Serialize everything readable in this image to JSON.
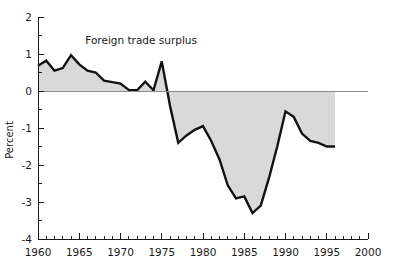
{
  "chart_data": {
    "type": "area",
    "title": "",
    "xlabel": "",
    "ylabel": "Percent",
    "xlim": [
      1960,
      2000
    ],
    "ylim": [
      -4,
      2
    ],
    "grid": false,
    "legend_position": "inline-annotation",
    "annotations": [
      {
        "text": "Foreign trade surplus",
        "x": 1972.5,
        "y": 1.28
      }
    ],
    "axis_colors": {
      "line": "#1a1a1a",
      "zero_line": "#8c8c8c"
    },
    "series": [
      {
        "name": "Foreign trade surplus",
        "fill_color": "#d9d9d9",
        "line_color": "#121212",
        "baseline": 0,
        "x": [
          1960,
          1961,
          1962,
          1963,
          1964,
          1965,
          1966,
          1967,
          1968,
          1969,
          1970,
          1971,
          1972,
          1973,
          1974,
          1975,
          1976,
          1977,
          1978,
          1979,
          1980,
          1981,
          1982,
          1983,
          1984,
          1985,
          1986,
          1987,
          1988,
          1989,
          1990,
          1991,
          1992,
          1993,
          1994,
          1995,
          1996
        ],
        "values": [
          0.68,
          0.82,
          0.55,
          0.62,
          0.97,
          0.72,
          0.55,
          0.5,
          0.28,
          0.24,
          0.2,
          0.03,
          0.02,
          0.25,
          0.02,
          0.8,
          -0.4,
          -1.4,
          -1.2,
          -1.05,
          -0.95,
          -1.35,
          -1.85,
          -2.55,
          -2.9,
          -2.85,
          -3.3,
          -3.1,
          -2.35,
          -1.5,
          -0.55,
          -0.7,
          -1.15,
          -1.35,
          -1.4,
          -1.5,
          -1.5
        ]
      }
    ],
    "x_axis": {
      "tick_step": 1,
      "label_step": 5,
      "tick_labels": [
        "1960",
        "1965",
        "1970",
        "1975",
        "1980",
        "1985",
        "1990",
        "1995",
        "2000"
      ],
      "tick_label_values": [
        1960,
        1965,
        1970,
        1975,
        1980,
        1985,
        1990,
        1995,
        2000
      ]
    },
    "y_axis": {
      "major_step": 1,
      "minor_step": 0.5,
      "tick_labels": [
        "2",
        "1",
        "0",
        "-1",
        "-2",
        "-3",
        "-4"
      ],
      "tick_label_values": [
        2,
        1,
        0,
        -1,
        -2,
        -3,
        -4
      ]
    }
  },
  "plot_geometry": {
    "left": 38,
    "right": 368,
    "top": 17,
    "bottom": 239
  }
}
